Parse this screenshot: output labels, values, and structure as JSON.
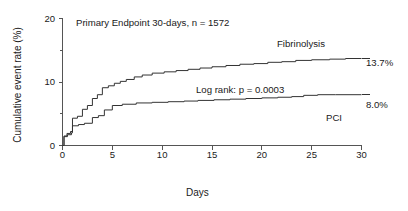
{
  "chart_data": {
    "type": "line",
    "subtype": "kaplan-meier-step",
    "title": "Primary Endpoint 30-days, n = 1572",
    "xlabel": "Days",
    "ylabel": "Cumulative event rate (%)",
    "xlim": [
      0,
      30
    ],
    "ylim": [
      0,
      20
    ],
    "xticks": [
      0,
      5,
      10,
      15,
      20,
      25,
      30
    ],
    "xtick_labels": [
      "0",
      "5",
      "10",
      "15",
      "20",
      "25",
      "30"
    ],
    "yticks": [
      0,
      10,
      20
    ],
    "ytick_labels": [
      "0",
      "10",
      "20"
    ],
    "yticks_minor": [
      5,
      15
    ],
    "grid": false,
    "legend_position": "inline-annotations",
    "annotations": [
      {
        "name": "logrank",
        "text": "Log rank: p = 0.0003",
        "x": 14,
        "y": 7.2
      }
    ],
    "series": [
      {
        "name": "Fibrinolysis",
        "label": "Fibrinolysis",
        "end_label": "13.7%",
        "final_value": 13.7,
        "color": "#333333",
        "points": [
          [
            0.0,
            0.0
          ],
          [
            0.15,
            1.5
          ],
          [
            0.45,
            1.9
          ],
          [
            0.8,
            2.2
          ],
          [
            1.0,
            4.3
          ],
          [
            1.5,
            4.6
          ],
          [
            2.0,
            5.7
          ],
          [
            2.5,
            6.3
          ],
          [
            3.0,
            7.4
          ],
          [
            3.5,
            8.0
          ],
          [
            4.0,
            9.1
          ],
          [
            4.6,
            9.4
          ],
          [
            5.2,
            9.8
          ],
          [
            5.8,
            10.1
          ],
          [
            6.4,
            10.4
          ],
          [
            7.2,
            10.8
          ],
          [
            8.0,
            11.1
          ],
          [
            9.0,
            11.4
          ],
          [
            10.2,
            11.6
          ],
          [
            11.4,
            11.8
          ],
          [
            12.6,
            12.0
          ],
          [
            13.8,
            12.2
          ],
          [
            15.0,
            12.4
          ],
          [
            16.4,
            12.6
          ],
          [
            17.8,
            12.8
          ],
          [
            19.2,
            12.9
          ],
          [
            20.6,
            13.1
          ],
          [
            22.0,
            13.2
          ],
          [
            23.4,
            13.4
          ],
          [
            25.0,
            13.5
          ],
          [
            26.8,
            13.6
          ],
          [
            28.4,
            13.7
          ],
          [
            30.0,
            13.7
          ]
        ]
      },
      {
        "name": "PCI",
        "label": "PCI",
        "end_label": "8.0%",
        "final_value": 8.0,
        "color": "#333333",
        "points": [
          [
            0.0,
            0.0
          ],
          [
            0.15,
            1.4
          ],
          [
            0.5,
            1.7
          ],
          [
            0.9,
            2.0
          ],
          [
            1.0,
            3.1
          ],
          [
            1.6,
            3.3
          ],
          [
            2.2,
            3.5
          ],
          [
            3.0,
            4.4
          ],
          [
            3.6,
            4.7
          ],
          [
            4.2,
            5.6
          ],
          [
            5.0,
            6.3
          ],
          [
            6.0,
            6.5
          ],
          [
            7.4,
            6.7
          ],
          [
            9.0,
            6.8
          ],
          [
            10.6,
            6.9
          ],
          [
            12.2,
            7.0
          ],
          [
            13.6,
            7.1
          ],
          [
            15.2,
            7.2
          ],
          [
            16.8,
            7.3
          ],
          [
            18.4,
            7.4
          ],
          [
            20.0,
            7.5
          ],
          [
            21.6,
            7.6
          ],
          [
            23.0,
            7.7
          ],
          [
            24.2,
            7.9
          ],
          [
            25.6,
            8.0
          ],
          [
            27.4,
            8.0
          ],
          [
            30.0,
            8.0
          ]
        ]
      }
    ]
  },
  "axis": {
    "x_title": "Days",
    "y_title": "Cumulative event rate (%)"
  },
  "colors": {
    "axis": "#555555",
    "curve": "#333333",
    "text": "#1a1a1a",
    "background": "#ffffff"
  }
}
